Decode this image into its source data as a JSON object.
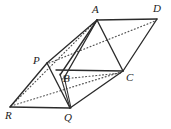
{
  "figure": {
    "background_color": "#ffffff",
    "solid_line_color": "#2b2b2b",
    "dotted_line_color": "#555555",
    "label_color": "#1c1c1c",
    "width": 171,
    "height": 129,
    "vertices": [
      {
        "id": "A",
        "label": "A",
        "x": 97,
        "y": 20,
        "label_x": 92,
        "label_y": 4
      },
      {
        "id": "D",
        "label": "D",
        "x": 157,
        "y": 19,
        "label_x": 153,
        "label_y": 3
      },
      {
        "id": "P",
        "label": "P",
        "x": 47,
        "y": 63,
        "label_x": 33,
        "label_y": 55
      },
      {
        "id": "B",
        "label": "B",
        "x": 63,
        "y": 72,
        "label_x": 63,
        "label_y": 73
      },
      {
        "id": "C",
        "label": "C",
        "x": 123,
        "y": 71,
        "label_x": 126,
        "label_y": 72
      },
      {
        "id": "R",
        "label": "R",
        "x": 10,
        "y": 107,
        "label_x": 5,
        "label_y": 110
      },
      {
        "id": "Q",
        "label": "Q",
        "x": 70,
        "y": 108,
        "label_x": 64,
        "label_y": 112
      }
    ],
    "solid_edges": [
      {
        "name": "edge-A-D",
        "from": "A",
        "to": "D"
      },
      {
        "name": "edge-A-P",
        "from": "A",
        "to": "P"
      },
      {
        "name": "edge-A-B",
        "from": "A",
        "to": "B"
      },
      {
        "name": "edge-A-C",
        "from": "A",
        "to": "C"
      },
      {
        "name": "edge-D-C",
        "from": "D",
        "to": "C"
      },
      {
        "name": "edge-P-C",
        "from": "P",
        "to": "C"
      },
      {
        "name": "edge-P-R",
        "from": "P",
        "to": "R"
      },
      {
        "name": "edge-P-Q",
        "from": "P",
        "to": "Q"
      },
      {
        "name": "edge-B-Q",
        "from": "B",
        "to": "Q"
      },
      {
        "name": "edge-C-Q",
        "from": "C",
        "to": "Q"
      },
      {
        "name": "edge-R-Q",
        "from": "R",
        "to": "Q"
      },
      {
        "name": "edge-A-Qside",
        "from": "A",
        "to": "Bq"
      }
    ],
    "dotted_edges": [
      {
        "name": "hidden-edge-P-D",
        "from": "P",
        "to": "D"
      },
      {
        "name": "hidden-edge-R-A",
        "from": "R",
        "to": "A"
      },
      {
        "name": "hidden-edge-R-C",
        "from": "R",
        "to": "C"
      },
      {
        "name": "hidden-edge-B-C",
        "from": "B",
        "to": "C"
      }
    ]
  }
}
